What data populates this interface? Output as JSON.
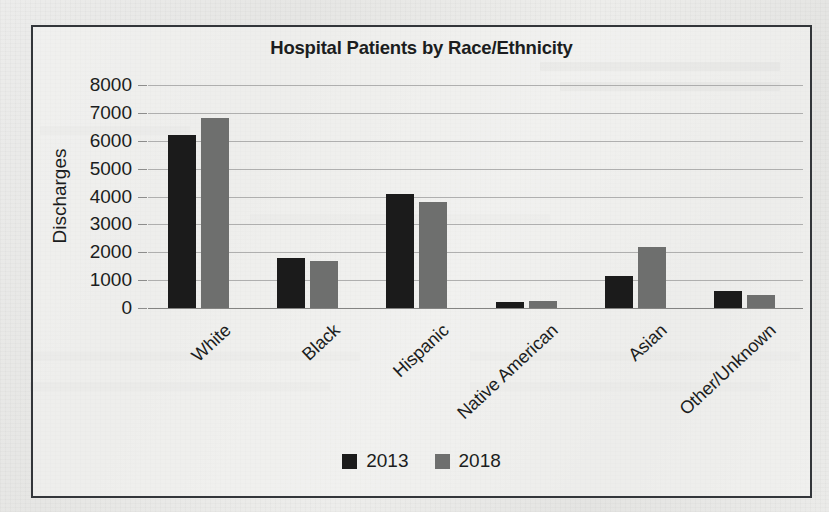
{
  "chart_data": {
    "type": "bar",
    "title": "Hospital Patients by Race/Ethnicity",
    "xlabel": "",
    "ylabel": "Discharges",
    "categories": [
      "White",
      "Black",
      "Hispanic",
      "Native American",
      "Asian",
      "Other/Unknown"
    ],
    "series": [
      {
        "name": "2013",
        "color": "#1b1b1b",
        "values": [
          6200,
          1800,
          4100,
          200,
          1150,
          600
        ]
      },
      {
        "name": "2018",
        "color": "#6e6f6e",
        "values": [
          6800,
          1700,
          3800,
          250,
          2200,
          450
        ]
      }
    ],
    "ylim": [
      0,
      8000
    ],
    "yticks": [
      8000,
      7000,
      6000,
      5000,
      4000,
      3000,
      2000,
      1000,
      0
    ],
    "ytick_labels": [
      "8000",
      "7000",
      "6000",
      "5000",
      "4000",
      "3000",
      "2000",
      "1000",
      "0"
    ],
    "grid": true,
    "legend_position": "bottom",
    "legend_entries": [
      "2013",
      "2018"
    ],
    "border": true
  }
}
